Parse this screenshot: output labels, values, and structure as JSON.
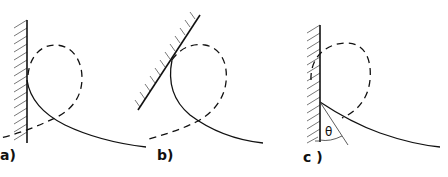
{
  "figure": {
    "panels": [
      {
        "id": "a",
        "label": "a)",
        "wall": "vertical",
        "description": "solid meniscus curve leaving vertical wall, dashed loop above"
      },
      {
        "id": "b",
        "label": "b)",
        "wall": "inclined",
        "description": "solid curve touching inclined wall, dashed loop"
      },
      {
        "id": "c",
        "label": "c )",
        "wall": "vertical",
        "description": "solid curve with contact angle marked",
        "angle_symbol": "θ"
      }
    ]
  }
}
